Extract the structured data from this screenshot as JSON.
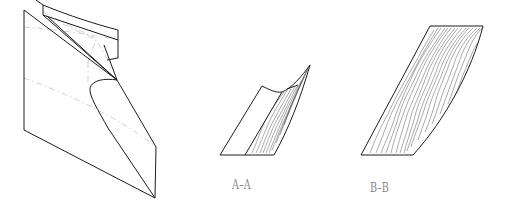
{
  "figure": {
    "views": [
      {
        "id": "perspective",
        "label": ""
      },
      {
        "id": "section-a",
        "label": "A–A"
      },
      {
        "id": "section-b",
        "label": "B–B"
      }
    ],
    "colors": {
      "line": "#1c1c1c",
      "hidden_line": "#c4c4c4",
      "label": "#8a8a8a",
      "background": "#ffffff"
    }
  }
}
